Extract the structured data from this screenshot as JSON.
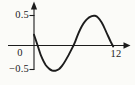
{
  "figure": {
    "background": "#fbfbf8",
    "ink": "#1c1c1c"
  },
  "labels": {
    "y_tick_top": "0.5",
    "origin": "0",
    "y_tick_bottom": "−0.5",
    "x_tick_right": "12"
  },
  "chart_data": {
    "type": "line",
    "title": "",
    "xlabel": "",
    "ylabel": "",
    "x_range": [
      0,
      12
    ],
    "y_range": [
      -0.5,
      0.5
    ],
    "x_tick_labels": [
      "12"
    ],
    "y_tick_labels": [
      "0.5",
      "0",
      "−0.5"
    ],
    "legend": null,
    "grid": false,
    "axis_style": "arrowed axes crossing at origin, serif tick labels",
    "points": [
      [
        0,
        0.18
      ],
      [
        0.5,
        0.02
      ],
      [
        1,
        -0.2
      ],
      [
        1.5,
        -0.35
      ],
      [
        2,
        -0.45
      ],
      [
        2.5,
        -0.51
      ],
      [
        3,
        -0.53
      ],
      [
        3.5,
        -0.52
      ],
      [
        4,
        -0.47
      ],
      [
        4.5,
        -0.38
      ],
      [
        5,
        -0.26
      ],
      [
        5.5,
        -0.13
      ],
      [
        6,
        0.0
      ],
      [
        6.5,
        0.14
      ],
      [
        7,
        0.27
      ],
      [
        7.5,
        0.37
      ],
      [
        8,
        0.44
      ],
      [
        8.5,
        0.48
      ],
      [
        9,
        0.5
      ],
      [
        9.5,
        0.49
      ],
      [
        10,
        0.43
      ],
      [
        10.5,
        0.34
      ],
      [
        11,
        0.21
      ],
      [
        11.5,
        0.09
      ],
      [
        12,
        -0.02
      ]
    ]
  }
}
